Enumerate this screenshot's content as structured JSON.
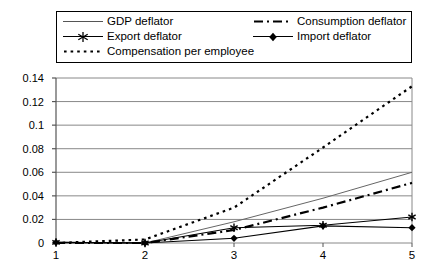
{
  "chart_data": {
    "type": "line",
    "title": "",
    "subtitle": "",
    "xlabel": "",
    "ylabel": "",
    "x": [
      1,
      2,
      3,
      4,
      5
    ],
    "categories": [
      "1",
      "2",
      "3",
      "4",
      "5"
    ],
    "xtick_labels": [
      "1",
      "2",
      "3",
      "4",
      "5"
    ],
    "ytick_labels": [
      "0",
      "0.02",
      "0.04",
      "0.06",
      "0.08",
      "0.1",
      "0.12",
      "0.14"
    ],
    "ytick_values": [
      0,
      0.02,
      0.04,
      0.06,
      0.08,
      0.1,
      0.12,
      0.14
    ],
    "ylim": [
      0,
      0.14
    ],
    "xlim": [
      1,
      5
    ],
    "grid": "horizontal",
    "legend_position": "top",
    "series": [
      {
        "name": "GDP deflator",
        "style": "solid-thin",
        "marker": "none",
        "color": "#666666",
        "values": [
          0.0,
          0.0,
          0.018,
          0.038,
          0.06
        ]
      },
      {
        "name": "Consumption deflator",
        "style": "dash-dot",
        "marker": "none",
        "color": "#000000",
        "values": [
          0.0,
          0.0,
          0.011,
          0.03,
          0.051
        ]
      },
      {
        "name": "Export deflator",
        "style": "solid",
        "marker": "star",
        "color": "#000000",
        "values": [
          0.0005,
          0.0,
          0.013,
          0.015,
          0.022
        ]
      },
      {
        "name": "Import deflator",
        "style": "solid",
        "marker": "diamond",
        "color": "#000000",
        "values": [
          0.0005,
          0.0,
          0.004,
          0.0145,
          0.013
        ]
      },
      {
        "name": "Compensation per employee",
        "style": "dotted",
        "marker": "none",
        "color": "#000000",
        "values": [
          0.0,
          0.003,
          0.03,
          0.081,
          0.133
        ]
      }
    ]
  },
  "legend": {
    "entries": [
      {
        "label": "GDP deflator"
      },
      {
        "label": "Consumption deflator"
      },
      {
        "label": "Export deflator"
      },
      {
        "label": "Import deflator"
      },
      {
        "label": "Compensation per employee"
      }
    ]
  }
}
